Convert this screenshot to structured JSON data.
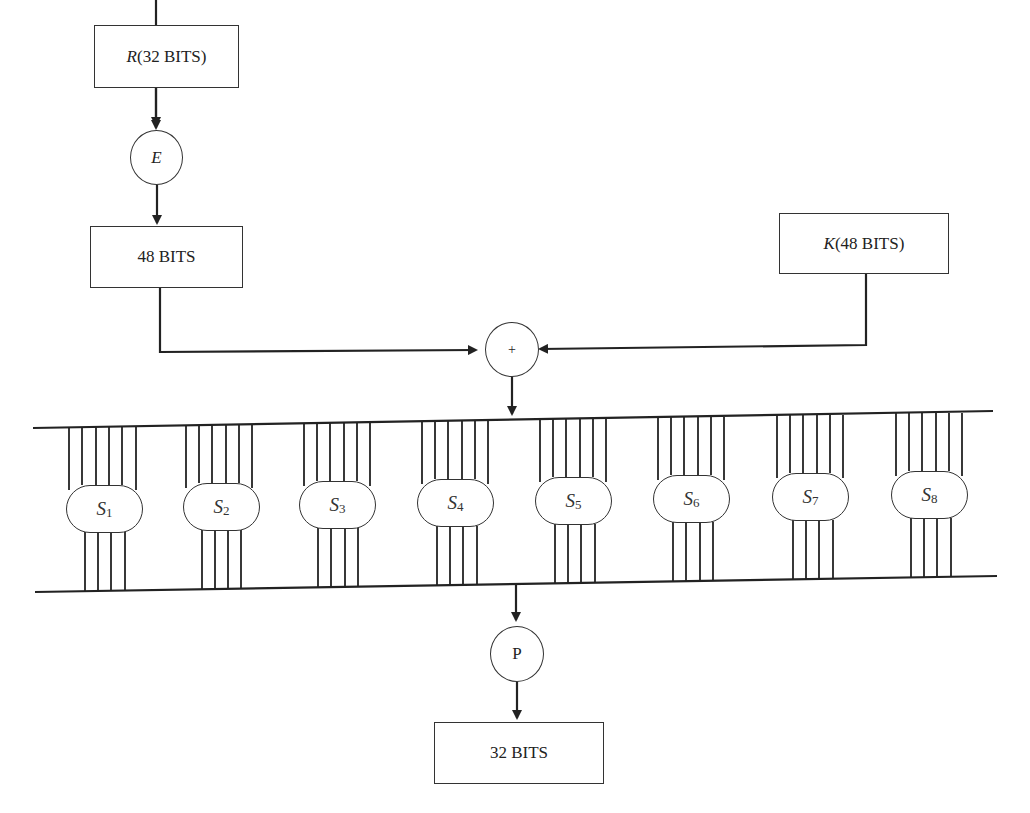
{
  "diagram": {
    "input_box": {
      "var": "R",
      "label": "(32 BITS)"
    },
    "expansion": {
      "label": "E"
    },
    "expanded_box": {
      "label": "48 BITS"
    },
    "key_box": {
      "var": "K",
      "label": "(48 BITS)"
    },
    "xor": {
      "label": "+"
    },
    "sboxes": [
      {
        "letter": "S",
        "index": "1"
      },
      {
        "letter": "S",
        "index": "2"
      },
      {
        "letter": "S",
        "index": "3"
      },
      {
        "letter": "S",
        "index": "4"
      },
      {
        "letter": "S",
        "index": "5"
      },
      {
        "letter": "S",
        "index": "6"
      },
      {
        "letter": "S",
        "index": "7"
      },
      {
        "letter": "S",
        "index": "8"
      }
    ],
    "sbox_inputs_per_box": 6,
    "sbox_outputs_per_box": 4,
    "permutation": {
      "label": "P"
    },
    "output_box": {
      "label": "32 BITS"
    }
  }
}
